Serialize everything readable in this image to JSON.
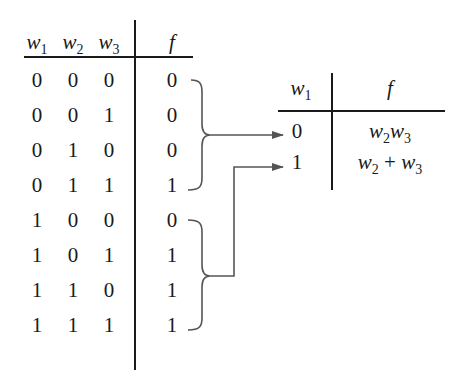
{
  "left_table": {
    "headers": [
      {
        "base": "w",
        "sub": "1"
      },
      {
        "base": "w",
        "sub": "2"
      },
      {
        "base": "w",
        "sub": "3"
      },
      {
        "base": "f",
        "sub": ""
      }
    ],
    "rows": [
      [
        "0",
        "0",
        "0",
        "0"
      ],
      [
        "0",
        "0",
        "1",
        "0"
      ],
      [
        "0",
        "1",
        "0",
        "0"
      ],
      [
        "0",
        "1",
        "1",
        "1"
      ],
      [
        "1",
        "0",
        "0",
        "0"
      ],
      [
        "1",
        "0",
        "1",
        "1"
      ],
      [
        "1",
        "1",
        "0",
        "1"
      ],
      [
        "1",
        "1",
        "1",
        "1"
      ]
    ]
  },
  "right_table": {
    "headers": [
      {
        "base": "w",
        "sub": "1"
      },
      {
        "base": "f",
        "sub": ""
      }
    ],
    "rows": [
      {
        "w1": "0",
        "f_parts": [
          {
            "base": "w",
            "sub": "2"
          },
          {
            "op": ""
          },
          {
            "base": "w",
            "sub": "3"
          }
        ]
      },
      {
        "w1": "1",
        "f_parts": [
          {
            "base": "w",
            "sub": "2"
          },
          {
            "op": " + "
          },
          {
            "base": "w",
            "sub": "3"
          }
        ]
      }
    ]
  },
  "colors": {
    "ink": "#1a1a1a",
    "arrow": "#555555"
  }
}
